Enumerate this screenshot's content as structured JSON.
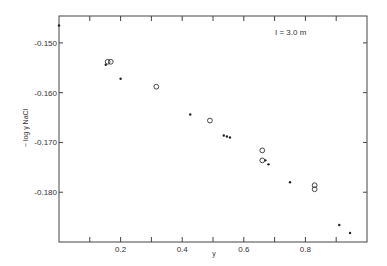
{
  "chart_data": {
    "type": "scatter",
    "title": "",
    "annotation": "I = 3.0 m",
    "xlabel": "y",
    "ylabel": "− log γ NaCl",
    "xlim": [
      0,
      1.0
    ],
    "ylim": [
      -0.19,
      -0.1446
    ],
    "grid": false,
    "legend": "none",
    "x_ticks": [
      0.1,
      0.2,
      0.3,
      0.4,
      0.5,
      0.6,
      0.7,
      0.8,
      0.9
    ],
    "x_tick_labels": [
      {
        "value": 0.2,
        "label": "0.2"
      },
      {
        "value": 0.4,
        "label": "0.4"
      },
      {
        "value": 0.6,
        "label": "0.6"
      },
      {
        "value": 0.8,
        "label": "0.8"
      }
    ],
    "y_tick_labels": [
      {
        "value": -0.15,
        "label": "-0.150"
      },
      {
        "value": -0.16,
        "label": "-0.160"
      },
      {
        "value": -0.17,
        "label": "-0.170"
      },
      {
        "value": -0.18,
        "label": "-0.180"
      }
    ],
    "series": [
      {
        "name": "filled",
        "marker": "dot",
        "points": [
          [
            0.0,
            -0.1465
          ],
          [
            0.152,
            -0.1544
          ],
          [
            0.2,
            -0.1572
          ],
          [
            0.426,
            -0.1644
          ],
          [
            0.535,
            -0.1686
          ],
          [
            0.545,
            -0.1688
          ],
          [
            0.555,
            -0.169
          ],
          [
            0.67,
            -0.1736
          ],
          [
            0.68,
            -0.1744
          ],
          [
            0.75,
            -0.178
          ],
          [
            0.91,
            -0.1866
          ],
          [
            0.945,
            -0.1882
          ]
        ]
      },
      {
        "name": "open",
        "marker": "circle",
        "points": [
          [
            0.158,
            -0.1538
          ],
          [
            0.168,
            -0.1538
          ],
          [
            0.316,
            -0.1588
          ],
          [
            0.49,
            -0.1656
          ],
          [
            0.66,
            -0.1716
          ],
          [
            0.66,
            -0.1736
          ],
          [
            0.83,
            -0.1786
          ],
          [
            0.83,
            -0.1794
          ]
        ]
      }
    ]
  }
}
